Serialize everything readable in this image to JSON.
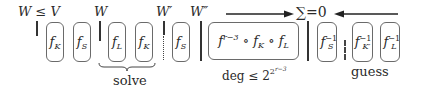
{
  "labels": {
    "w_le_v": "W ≤ V",
    "w": "W",
    "w_prime": "W′",
    "w_dprime": "W″",
    "sum_zero": "∑=0"
  },
  "boxes": [
    {
      "id": "fK-1",
      "base": "f",
      "sub": "K",
      "sup": ""
    },
    {
      "id": "fS-1",
      "base": "f",
      "sub": "S",
      "sup": ""
    },
    {
      "id": "fL-solve",
      "base": "f",
      "sub": "L",
      "sup": ""
    },
    {
      "id": "fK-solve",
      "base": "f",
      "sub": "K",
      "sup": ""
    },
    {
      "id": "fS-2",
      "base": "f",
      "sub": "S",
      "sup": ""
    },
    {
      "id": "fS-inv",
      "base": "f",
      "sub": "S",
      "sup": "−1"
    },
    {
      "id": "fK-prime-inv",
      "base": "f",
      "sub": "K′",
      "sup": "−1"
    },
    {
      "id": "fL-inv",
      "base": "f",
      "sub": "L",
      "sup": "−1"
    }
  ],
  "composite": {
    "f": "f",
    "exp": "r−3",
    "circ1": " ∘ ",
    "fK": "f",
    "fK_sub": "K",
    "circ2": " ∘ ",
    "fL": "f",
    "fL_sub": "L"
  },
  "degree": {
    "prefix": "deg ≤ 2",
    "exp_base": "2",
    "exp_exp": "r−3"
  },
  "annotations": {
    "solve": "solve",
    "guess": "guess"
  }
}
